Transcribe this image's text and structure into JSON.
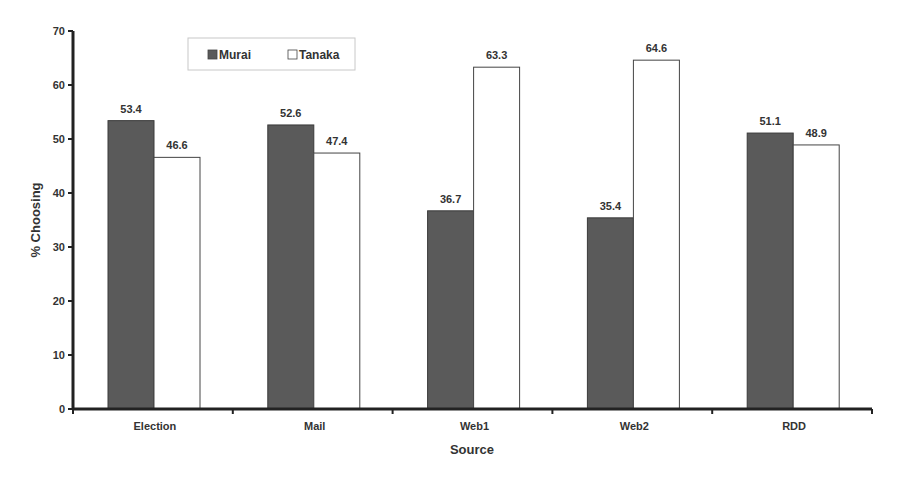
{
  "chart_data": {
    "type": "bar",
    "title": "",
    "xlabel": "Source",
    "ylabel": "% Choosing",
    "ylim": [
      0,
      70
    ],
    "yticks": [
      0,
      10,
      20,
      30,
      40,
      50,
      60,
      70
    ],
    "grid": false,
    "legend_position": "top-left (inside plot)",
    "categories": [
      "Election",
      "Mail",
      "Web1",
      "Web2",
      "RDD"
    ],
    "series": [
      {
        "name": "Murai",
        "color": "#5a5a5a",
        "values": [
          53.4,
          52.6,
          36.7,
          35.4,
          51.1
        ]
      },
      {
        "name": "Tanaka",
        "color": "#ffffff",
        "values": [
          46.6,
          47.4,
          63.3,
          64.6,
          48.9
        ]
      }
    ],
    "data_labels": {
      "Murai": [
        "53.4",
        "52.6",
        "36.7",
        "35.4",
        "51.1"
      ],
      "Tanaka": [
        "46.6",
        "47.4",
        "63.3",
        "64.6",
        "48.9"
      ]
    }
  },
  "legend": {
    "items": [
      {
        "label": "Murai"
      },
      {
        "label": "Tanaka"
      }
    ]
  }
}
